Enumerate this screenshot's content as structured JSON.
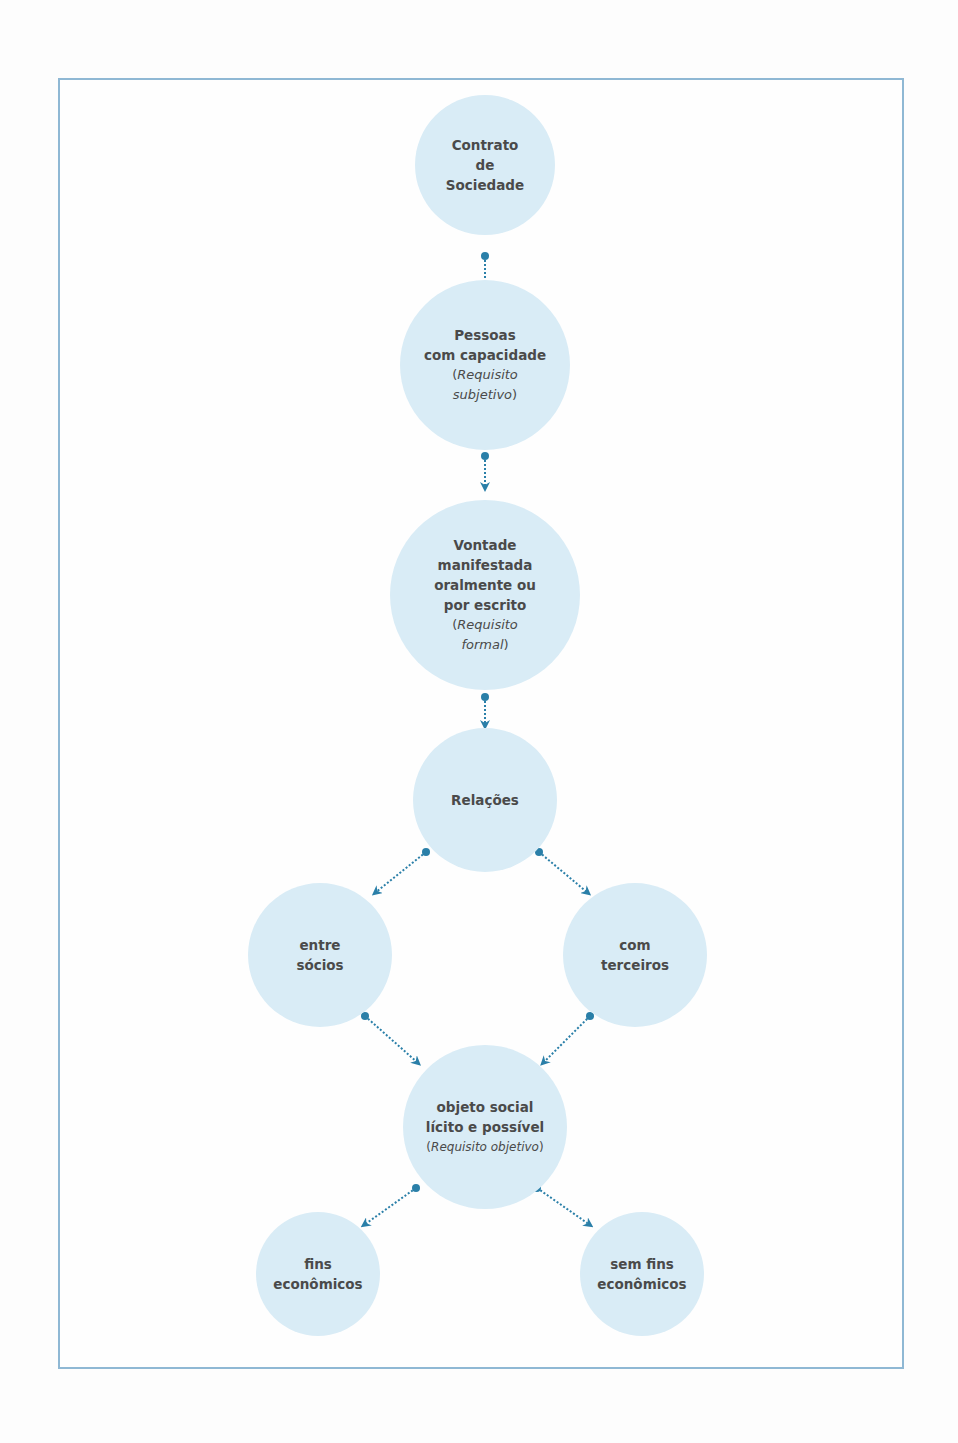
{
  "diagram": {
    "colors": {
      "node_fill": "#d9ecf6",
      "arrow": "#2a7fa8",
      "frame": "#8fb8d4",
      "text": "#4a4a4a"
    },
    "nodes": [
      {
        "id": "contrato",
        "lines": [
          "Contrato",
          "de",
          "Sociedade"
        ]
      },
      {
        "id": "pessoas",
        "lines": [
          "Pessoas",
          "com capacidade"
        ],
        "sub": {
          "open": "(",
          "italic_1": "Requisito",
          "italic_2": "subjetivo",
          "close": ")"
        }
      },
      {
        "id": "vontade",
        "lines": [
          "Vontade",
          "manifestada",
          "oralmente ou",
          "por escrito"
        ],
        "sub": {
          "open": "(",
          "italic_1": "Requisito",
          "italic_2": "formal",
          "close": ")"
        }
      },
      {
        "id": "relacoes",
        "lines": [
          "Relações"
        ]
      },
      {
        "id": "entre-socios",
        "lines": [
          "entre",
          "sócios"
        ]
      },
      {
        "id": "com-terceiros",
        "lines": [
          "com",
          "terceiros"
        ]
      },
      {
        "id": "objeto-social",
        "lines": [
          "objeto social",
          "lícito e possível"
        ],
        "sub": {
          "open": "(",
          "italic": "Requisito objetivo",
          "close": ")"
        }
      },
      {
        "id": "fins-economicos",
        "lines": [
          "fins",
          "econômicos"
        ]
      },
      {
        "id": "sem-fins-economicos",
        "lines": [
          "sem fins",
          "econômicos"
        ]
      }
    ],
    "edges": [
      {
        "from": "contrato",
        "to": "pessoas"
      },
      {
        "from": "pessoas",
        "to": "vontade"
      },
      {
        "from": "vontade",
        "to": "relacoes"
      },
      {
        "from": "relacoes",
        "to": "entre-socios"
      },
      {
        "from": "relacoes",
        "to": "com-terceiros"
      },
      {
        "from": "entre-socios",
        "to": "objeto-social"
      },
      {
        "from": "com-terceiros",
        "to": "objeto-social"
      },
      {
        "from": "objeto-social",
        "to": "fins-economicos"
      },
      {
        "from": "objeto-social",
        "to": "sem-fins-economicos"
      }
    ]
  }
}
